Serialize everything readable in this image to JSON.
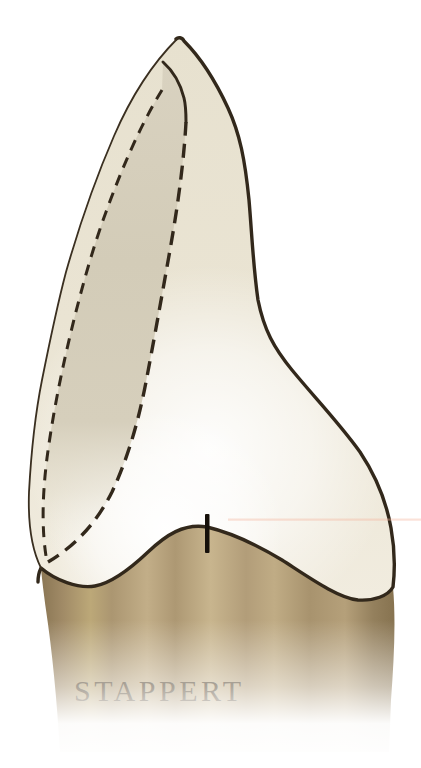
{
  "figure": {
    "credit": "STAPPERT",
    "colors": {
      "outline": "#32281b",
      "thin_contour": "#3a2f20",
      "dashed_line": "#32281b",
      "crown_base": "#e9e3d1",
      "prep_band": "#d5ceba",
      "root_mid": "#b7a37e",
      "root_edge": "#8a7654",
      "credit_text": "#4a3a22",
      "cervical_tick": "#16100a",
      "scan_artifact": "#f5b49b"
    }
  }
}
